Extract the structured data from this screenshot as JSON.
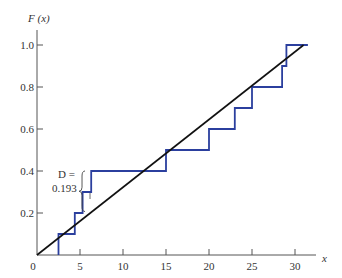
{
  "chart_data": {
    "type": "line",
    "title": "",
    "xlabel": "x",
    "ylabel": "F (x)",
    "xlim": [
      0,
      32
    ],
    "ylim": [
      0,
      1.05
    ],
    "x_ticks": [
      0,
      5,
      10,
      15,
      20,
      25,
      30
    ],
    "x_tick_labels": [
      "0",
      "5",
      "10",
      "15",
      "20",
      "25",
      "30"
    ],
    "y_ticks": [
      0.2,
      0.4,
      0.6,
      0.8,
      1.0
    ],
    "y_tick_labels": [
      "0.2",
      "0.4",
      "0.6",
      "0.8",
      "1.0"
    ],
    "grid": false,
    "legend": null,
    "series": [
      {
        "name": "Empirical CDF (step)",
        "style": "step",
        "color": "#2b3f9e",
        "points": [
          [
            2.5,
            0.0
          ],
          [
            2.5,
            0.1
          ],
          [
            4.4,
            0.1
          ],
          [
            4.4,
            0.2
          ],
          [
            5.3,
            0.2
          ],
          [
            5.3,
            0.3
          ],
          [
            6.3,
            0.3
          ],
          [
            6.3,
            0.4
          ],
          [
            15.0,
            0.4
          ],
          [
            15.0,
            0.5
          ],
          [
            20.0,
            0.5
          ],
          [
            20.0,
            0.6
          ],
          [
            23.0,
            0.6
          ],
          [
            23.0,
            0.7
          ],
          [
            25.0,
            0.7
          ],
          [
            25.0,
            0.8
          ],
          [
            28.5,
            0.8
          ],
          [
            28.5,
            0.9
          ],
          [
            29.0,
            0.9
          ],
          [
            29.0,
            1.0
          ],
          [
            31.5,
            1.0
          ]
        ]
      },
      {
        "name": "Hypothesized CDF",
        "style": "line",
        "color": "#111111",
        "points": [
          [
            0,
            0
          ],
          [
            31,
            1.0
          ]
        ]
      }
    ],
    "annotations": [
      {
        "text": "D =",
        "x": 4.3,
        "y": 0.36
      },
      {
        "text": "0.193",
        "x": 4.3,
        "y": 0.31
      },
      {
        "type": "brace",
        "x": 5.7,
        "y_from": 0.207,
        "y_to": 0.4,
        "label": "D = 0.193"
      }
    ]
  },
  "labels": {
    "ylabel": "F (x)",
    "xlabel": "x",
    "d_label": "D =",
    "d_value": "0.193",
    "origin": "0"
  }
}
